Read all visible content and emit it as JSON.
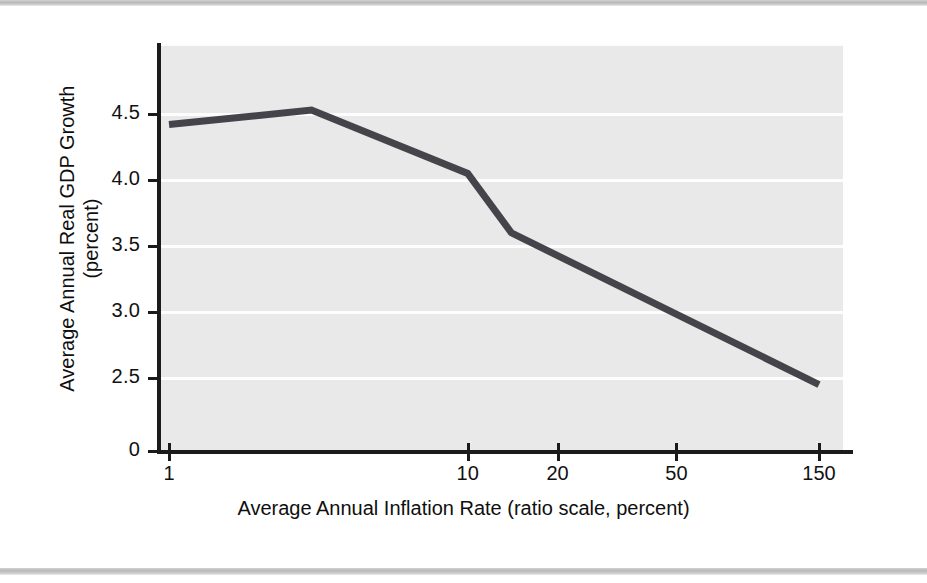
{
  "figure": {
    "background_color": "#ffffff",
    "plot_background_color": "#e9e9e9",
    "gridline_color": "#fdfdfd",
    "axis_color": "#1b1b1b",
    "series_color": "#44444a",
    "band_color": "#b8b8b8"
  },
  "chart_data": {
    "type": "line",
    "title": "",
    "xlabel": "Average Annual Inflation Rate (ratio scale, percent)",
    "ylabel": "Average Annual Real GDP Growth",
    "ylabel_line2": "(percent)",
    "xscale": "log",
    "xlim": [
      1,
      165
    ],
    "ylim": [
      2.28,
      4.78
    ],
    "y_axis_broken_at_zero": true,
    "grid": true,
    "grid_axis": "y",
    "legend": "none",
    "xticks": [
      1,
      10,
      20,
      50,
      150
    ],
    "xtick_labels": [
      "1",
      "10",
      "20",
      "50",
      "150"
    ],
    "yticks": [
      2.5,
      3.0,
      3.5,
      4.0,
      4.5
    ],
    "ytick_labels": [
      "2.5",
      "3.0",
      "3.5",
      "4.0",
      "4.5"
    ],
    "y_zero_label": "0",
    "series": [
      {
        "name": "Average Annual Real GDP Growth",
        "x": [
          1,
          3,
          10,
          14,
          150
        ],
        "values": [
          4.42,
          4.53,
          4.05,
          3.6,
          2.45
        ]
      }
    ]
  },
  "labels": {
    "y_tick_0": "0"
  }
}
